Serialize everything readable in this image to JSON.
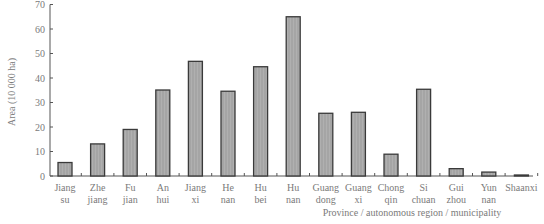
{
  "chart_data": {
    "type": "bar",
    "title": "",
    "xlabel": "Province / autonomous region / municipality",
    "ylabel": "Area (10 000 ha)",
    "ylim": [
      0,
      70
    ],
    "yticks": [
      0,
      10,
      20,
      30,
      40,
      50,
      60,
      70
    ],
    "grid": false,
    "legend": null,
    "categories": [
      [
        "Jiang",
        "su"
      ],
      [
        "Zhe",
        "jiang"
      ],
      [
        "Fu",
        "jian"
      ],
      [
        "An",
        "hui"
      ],
      [
        "Jiang",
        "xi"
      ],
      [
        "He",
        "nan"
      ],
      [
        "Hu",
        "bei"
      ],
      [
        "Hu",
        "nan"
      ],
      [
        "Guang",
        "dong"
      ],
      [
        "Guang",
        "xi"
      ],
      [
        "Chong",
        "qin"
      ],
      [
        "Si",
        "chuan"
      ],
      [
        "Gui",
        "zhou"
      ],
      [
        "Yun",
        "nan"
      ],
      [
        "Shaanxi",
        ""
      ]
    ],
    "values": [
      5.5,
      13.1,
      19.0,
      35.1,
      46.8,
      34.6,
      44.6,
      65.0,
      25.6,
      26.0,
      8.9,
      35.4,
      3.0,
      1.6,
      0.2
    ],
    "bar_fill": "#a9a9a9",
    "bar_stroke": "#3a3a3a"
  }
}
